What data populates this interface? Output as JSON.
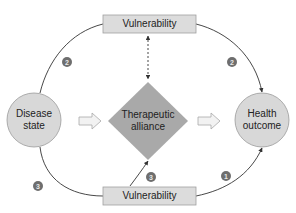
{
  "nodes": {
    "vulnerability_top": {
      "label": "Vulnerability"
    },
    "vulnerability_bottom": {
      "label": "Vulnerability"
    },
    "disease_state": {
      "line1": "Disease",
      "line2": "state"
    },
    "health_outcome": {
      "line1": "Health",
      "line2": "outcome"
    },
    "therapeutic_alliance": {
      "line1": "Therapeutic",
      "line2": "alliance"
    }
  },
  "badges": {
    "top_left": "2",
    "top_right": "2",
    "bottom_left": "3",
    "bottom_center": "3",
    "bottom_right": "1"
  },
  "colors": {
    "box_fill": "#dcdcdc",
    "box_stroke": "#a0a0a0",
    "circle_fill": "#d8d8d8",
    "circle_stroke": "#9a9a9a",
    "diamond_fill": "#a9a9a9",
    "line": "#333333",
    "badge": "#6e6e6e",
    "hollow_arrow_fill": "#f2f2f2",
    "hollow_arrow_stroke": "#a8a8a8"
  }
}
